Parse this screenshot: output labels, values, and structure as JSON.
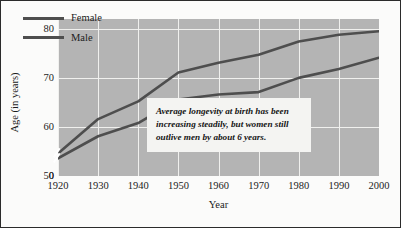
{
  "figure": {
    "background_color": "#fbfbfa",
    "border_color": "#2b2b2b",
    "plot_background_color": "#b4b4b4",
    "gridline_color": "#f0f0ee",
    "line_color": "#4e4e4e"
  },
  "legend": {
    "position": "top-left-inside",
    "entries": [
      {
        "label": "Female",
        "color": "#4e4e4e"
      },
      {
        "label": "Male",
        "color": "#4e4e4e"
      }
    ]
  },
  "annotation": {
    "text": "Average longevity at birth has been increasing steadily, but women still outlive men by about 6 years.",
    "background_color": "#f4f4f2"
  },
  "axes": {
    "x": {
      "label": "Year",
      "ticks": [
        "1920",
        "1930",
        "1940",
        "1950",
        "1960",
        "1970",
        "1980",
        "1990",
        "2000"
      ]
    },
    "y": {
      "label": "Age (in years)",
      "ticks": [
        "0",
        "50",
        "60",
        "70",
        "80"
      ],
      "has_axis_break": true
    }
  },
  "chart_data": {
    "type": "line",
    "title": "",
    "xlabel": "Year",
    "ylabel": "Age (in years)",
    "x": [
      1920,
      1930,
      1940,
      1950,
      1960,
      1970,
      1980,
      1990,
      2000
    ],
    "xlim": [
      1920,
      2000
    ],
    "ylim": [
      50,
      82
    ],
    "y_axis_break_below": 50,
    "grid": true,
    "legend_position": "top-left-inside",
    "series": [
      {
        "name": "Female",
        "color": "#4e4e4e",
        "values": [
          54.6,
          61.6,
          65.2,
          71.1,
          73.1,
          74.7,
          77.4,
          78.8,
          79.5
        ]
      },
      {
        "name": "Male",
        "color": "#4e4e4e",
        "values": [
          53.6,
          58.1,
          60.8,
          65.6,
          66.6,
          67.1,
          70.0,
          71.8,
          74.1
        ]
      }
    ],
    "annotations": [
      {
        "text": "Average longevity at birth has been increasing steadily, but women still outlive men by about 6 years."
      }
    ]
  }
}
